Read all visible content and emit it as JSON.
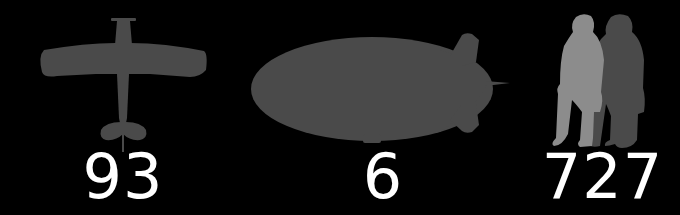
{
  "colors": {
    "background": "#000000",
    "silhouette_dark": "#4a4a4a",
    "silhouette_light": "#8c8c8c",
    "number": "#ffffff"
  },
  "items": [
    {
      "icon": "airplane-icon",
      "label": "airplane",
      "count": "93"
    },
    {
      "icon": "airship-icon",
      "label": "airship",
      "count": "6"
    },
    {
      "icon": "people-icon",
      "label": "people",
      "count": "727"
    }
  ]
}
